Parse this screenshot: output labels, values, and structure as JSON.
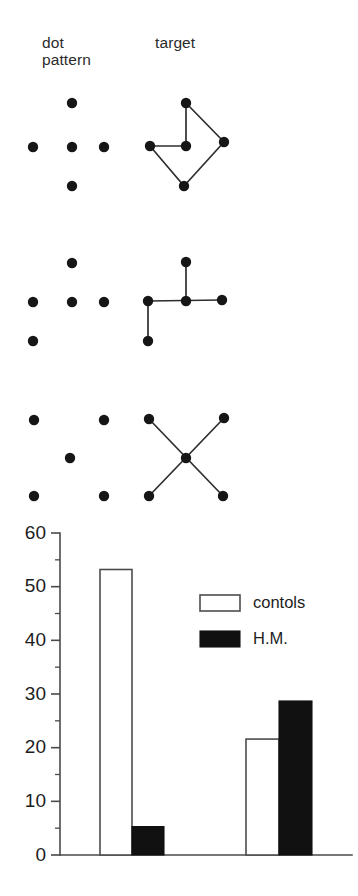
{
  "headers": {
    "dot_pattern": "dot\npattern",
    "target": "target"
  },
  "colors": {
    "dot": "#161616",
    "line": "#2e2e2e",
    "axis": "#4a4a4a",
    "bar_open_fill": "#ffffff",
    "bar_open_stroke": "#4d4d4d",
    "bar_filled": "#111111",
    "background": "#ffffff",
    "text": "#1d1d1d"
  },
  "stimuli": [
    {
      "row": 1,
      "dot_pattern_name": "plus-diamond-5-dots",
      "dots": [
        {
          "x": 72,
          "y": 103
        },
        {
          "x": 33,
          "y": 147
        },
        {
          "x": 72,
          "y": 147
        },
        {
          "x": 104,
          "y": 147
        },
        {
          "x": 72,
          "y": 186
        }
      ],
      "target_name": "kite-polygon-target",
      "target_dots": [
        {
          "x": 186,
          "y": 103
        },
        {
          "x": 150,
          "y": 146
        },
        {
          "x": 186,
          "y": 146
        },
        {
          "x": 224,
          "y": 142
        },
        {
          "x": 184,
          "y": 186
        }
      ],
      "target_lines": [
        [
          186,
          103,
          186,
          146
        ],
        [
          186,
          103,
          224,
          142
        ],
        [
          150,
          146,
          186,
          146
        ],
        [
          150,
          146,
          184,
          186
        ],
        [
          184,
          186,
          224,
          142
        ]
      ]
    },
    {
      "row": 2,
      "dot_pattern_name": "tee-5-dots",
      "dots": [
        {
          "x": 72,
          "y": 263
        },
        {
          "x": 33,
          "y": 302
        },
        {
          "x": 72,
          "y": 302
        },
        {
          "x": 104,
          "y": 302
        },
        {
          "x": 33,
          "y": 341
        }
      ],
      "target_name": "tee-junction-target",
      "target_dots": [
        {
          "x": 186,
          "y": 262
        },
        {
          "x": 148,
          "y": 301
        },
        {
          "x": 186,
          "y": 301
        },
        {
          "x": 222,
          "y": 300
        },
        {
          "x": 148,
          "y": 341
        }
      ],
      "target_lines": [
        [
          186,
          262,
          186,
          301
        ],
        [
          148,
          301,
          222,
          300
        ],
        [
          148,
          301,
          148,
          341
        ]
      ]
    },
    {
      "row": 3,
      "dot_pattern_name": "x-5-dots",
      "dots": [
        {
          "x": 34,
          "y": 420
        },
        {
          "x": 104,
          "y": 420
        },
        {
          "x": 70,
          "y": 458
        },
        {
          "x": 34,
          "y": 496
        },
        {
          "x": 104,
          "y": 496
        }
      ],
      "target_name": "x-cross-target",
      "target_dots": [
        {
          "x": 149,
          "y": 419
        },
        {
          "x": 224,
          "y": 418
        },
        {
          "x": 186,
          "y": 458
        },
        {
          "x": 149,
          "y": 496
        },
        {
          "x": 223,
          "y": 496
        }
      ],
      "target_lines": [
        [
          149,
          419,
          223,
          496
        ],
        [
          224,
          418,
          149,
          496
        ]
      ]
    }
  ],
  "chart_data": {
    "type": "bar",
    "title": "",
    "xlabel": "",
    "ylabel": "",
    "ylim": [
      0,
      60
    ],
    "yticks": [
      0,
      10,
      20,
      30,
      40,
      50,
      60
    ],
    "ytick_labels": [
      "0",
      "10",
      "20",
      "30",
      "40",
      "50",
      "60"
    ],
    "minor_yticks": [
      5,
      15,
      25,
      35,
      45,
      55
    ],
    "grid": false,
    "categories": [
      "group 1",
      "group 2"
    ],
    "series": [
      {
        "name": "contols",
        "style": "open",
        "values": [
          53.2,
          21.6
        ]
      },
      {
        "name": "H.M.",
        "style": "filled",
        "values": [
          5.3,
          28.7
        ]
      }
    ],
    "legend": {
      "position": "upper-right-inside",
      "entries": [
        {
          "label": "contols",
          "swatch": "open"
        },
        {
          "label": "H.M.",
          "swatch": "filled"
        }
      ]
    }
  }
}
